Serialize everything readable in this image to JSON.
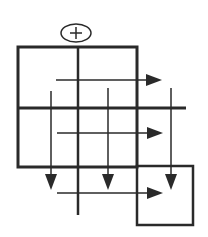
{
  "diagram": {
    "title": "",
    "colors": {
      "stroke": "#2a2a2a",
      "background": "#ffffff"
    },
    "origin_marker": {
      "symbol": "+",
      "shape": "ellipse",
      "cx": 76,
      "cy": 33,
      "rx": 15,
      "ry": 9
    },
    "outer_frame": {
      "x": 18,
      "y": 47,
      "width": 119,
      "height": 120
    },
    "center_vertical_divider": {
      "x": 78,
      "y1": 47,
      "y2": 215
    },
    "middle_horizontal_divider": {
      "y": 108,
      "x1": 18,
      "x2": 186
    },
    "highlight_box": {
      "x": 137,
      "y": 166,
      "width": 56,
      "height": 59
    },
    "horizontal_arrows": [
      {
        "y": 80,
        "x1": 56,
        "x2": 162
      },
      {
        "y": 133,
        "x1": 57,
        "x2": 163
      },
      {
        "y": 193,
        "x1": 57,
        "x2": 163
      }
    ],
    "vertical_arrows": [
      {
        "x": 51,
        "y1": 91,
        "y2": 190
      },
      {
        "x": 108,
        "y1": 88,
        "y2": 190
      },
      {
        "x": 171,
        "y1": 88,
        "y2": 190
      }
    ]
  }
}
